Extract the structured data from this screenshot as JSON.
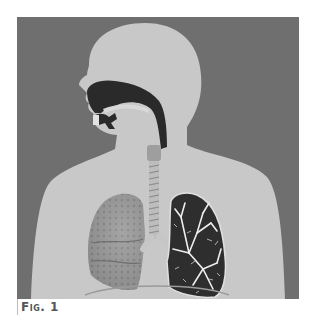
{
  "figure": {
    "caption": "Fig. 1",
    "colors": {
      "background": "#6f6f6f",
      "body": "#c8c8c8",
      "airway": "#2a2a2a",
      "lung_left_fill": "#9a9a9a",
      "lung_right_fill": "#2e2e2e",
      "bronchi": "#ededed"
    },
    "parts": [
      {
        "id": "nasal-cavity",
        "label": "Nasal cavity"
      },
      {
        "id": "oral-cavity",
        "label": "Oral cavity"
      },
      {
        "id": "pharynx",
        "label": "Pharynx"
      },
      {
        "id": "larynx",
        "label": "Larynx"
      },
      {
        "id": "trachea",
        "label": "Trachea"
      },
      {
        "id": "bronchi",
        "label": "Bronchi"
      },
      {
        "id": "lung-right",
        "label": "Right lung (lobes)"
      },
      {
        "id": "lung-left",
        "label": "Left lung (bronchial tree)"
      },
      {
        "id": "diaphragm",
        "label": "Diaphragm"
      }
    ]
  }
}
